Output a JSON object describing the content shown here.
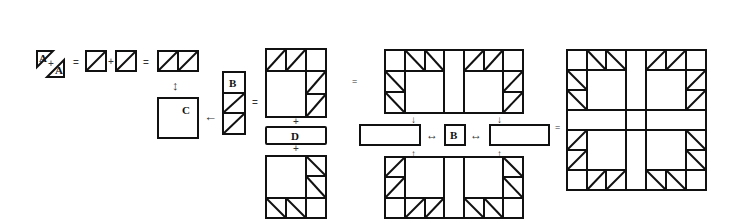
{
  "diagram": {
    "labels": {
      "a1": "A",
      "a2": "A",
      "b_strip": "B",
      "c_square": "C",
      "d_strip": "D",
      "b_center": "B"
    },
    "symbols": {
      "plus": "+",
      "equals": "=",
      "swap_arrow": "↔",
      "left_arrow": "←",
      "down_arrow": "↓",
      "up_arrow": "↑",
      "vertical_swap": "↕"
    },
    "steps": [
      "Triangle A + Triangle A = half-square triangle unit",
      "Unit + Unit = two-unit strip",
      "Two-unit strip attached to square C",
      "B + two units strip attached to C",
      "Corner block + D strip + corner block",
      "Two halves joined with side strips and center square B",
      "Completed block"
    ],
    "colors": {
      "stroke": "#111111",
      "background": "#ffffff"
    }
  }
}
